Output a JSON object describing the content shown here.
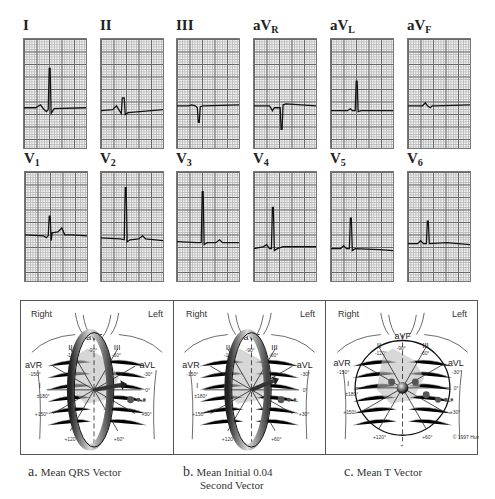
{
  "figure": {
    "leads_row1": [
      {
        "id": "I",
        "label": "I",
        "sub": "",
        "trace": "M0 70 L12 70 L17 67 L20 71 L23 74 L25 72 L26 30 L27 30 L28 76 L31 71 L64 70"
      },
      {
        "id": "II",
        "label": "II",
        "sub": "",
        "trace": "M0 73 L12 72 L16 68 L19 73 L21 76 L22 60 L24 60 L25 77 L28 75 L64 72"
      },
      {
        "id": "III",
        "label": "III",
        "sub": "",
        "trace": "M0 68 L12 68 L15 67 L19 68 L21 70 L22 85 L23 85 L24 69 L27 68 L64 67"
      },
      {
        "id": "aVR",
        "label": "aV",
        "sub": "R",
        "trace": "M0 68 L16 68 L19 73 L21 70 L27 70 L28 92 L29 92 L30 67 L33 66 L64 68"
      },
      {
        "id": "aVL",
        "label": "aV",
        "sub": "L",
        "trace": "M0 73 L17 73 L20 71 L22 73 L25 73 L26 43 L27 43 L28 74 L31 73 L64 73"
      },
      {
        "id": "aVF",
        "label": "aV",
        "sub": "F",
        "trace": "M0 68 L15 68 L18 65 L20 68 L23 70 L25 68 L28 68 L64 67"
      }
    ],
    "leads_row2": [
      {
        "id": "V1",
        "label": "V",
        "sub": "1",
        "trace": "M0 64 L19 65 L22 67 L24 65 L25 45 L26 45 L27 70 L28 62 L34 61 L38 57 L41 64 L48 64 L64 65"
      },
      {
        "id": "V2",
        "label": "V",
        "sub": "2",
        "trace": "M0 67 L20 68 L24 69 L25 16 L26 16 L27 71 L30 69 L39 68 L43 65 L46 68 L64 70"
      },
      {
        "id": "V3",
        "label": "V",
        "sub": "3",
        "trace": "M0 71 L21 72 L25 72 L26 20 L27 20 L28 74 L31 72 L40 72 L44 69 L47 72 L64 72"
      },
      {
        "id": "V4",
        "label": "V",
        "sub": "4",
        "trace": "M0 78 L10 76 L13 74 L16 78 L18 78 L19 36 L20 36 L21 80 L24 78 L30 76 L64 76"
      },
      {
        "id": "V5",
        "label": "V",
        "sub": "5",
        "trace": "M0 78 L10 78 L13 75 L16 78 L19 78 L20 47 L21 47 L22 80 L25 78 L50 79 L64 80"
      },
      {
        "id": "V6",
        "label": "V",
        "sub": "6",
        "trace": "M0 73 L10 73 L13 70 L16 73 L19 73 L20 50 L21 50 L22 73 L40 72 L64 74"
      }
    ],
    "diagrams": [
      {
        "id": "a",
        "right_label": "Right",
        "left_label": "Left",
        "view": "Mean QRS Vector",
        "ring": "tilted"
      },
      {
        "id": "b",
        "right_label": "Right",
        "left_label": "Left",
        "view": "Mean Initial 0.04 Second Vector",
        "ring": "tilted"
      },
      {
        "id": "c",
        "right_label": "Right",
        "left_label": "Left",
        "view": "Mean T Vector",
        "ring": "flat",
        "copyright": "© 1997 Hurst"
      }
    ],
    "hexaxial_labels": {
      "II": "II",
      "aVF": "aVF",
      "III": "III",
      "aVR": "aVR",
      "aVL": "aVL",
      "I": "I",
      "angles": [
        "-90°",
        "-120°",
        "-60°",
        "-150°",
        "-30°",
        "±180°",
        "0°",
        "+150°",
        "+30°",
        "+120°",
        "+60°",
        "+90°"
      ]
    },
    "captions": [
      {
        "letter": "a.",
        "text": "Mean QRS Vector"
      },
      {
        "letter": "b.",
        "text": "Mean Initial 0.04",
        "text2": "Second Vector"
      },
      {
        "letter": "c.",
        "text": "Mean T Vector"
      }
    ]
  }
}
